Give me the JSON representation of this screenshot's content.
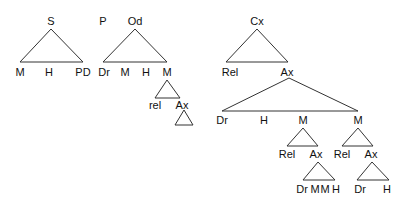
{
  "diagram": {
    "type": "syntax-trees",
    "stroke_color": "#333333",
    "trees": [
      {
        "root": "S",
        "children": [
          "M",
          "H",
          "PD"
        ]
      },
      {
        "pre_label": "P",
        "root": "Od",
        "children": [
          "Dr",
          "M",
          "H",
          "M"
        ],
        "sub": {
          "parent": "M",
          "children": [
            "rel",
            "Ax"
          ],
          "leaf_triangle_under": "Ax"
        }
      },
      {
        "root": "Cx",
        "children": [
          "Rel",
          "Ax"
        ],
        "sub": {
          "parent": "Ax",
          "children": [
            "Dr",
            "H",
            "M",
            "M"
          ],
          "branches": [
            {
              "parent": "M",
              "children": [
                "Rel",
                "Ax"
              ],
              "ax_children": [
                "Dr",
                "M",
                "M",
                "H"
              ]
            },
            {
              "parent": "M",
              "children": [
                "Rel",
                "Ax"
              ],
              "ax_children": [
                "Dr",
                "H"
              ]
            }
          ]
        }
      }
    ]
  },
  "labels": {
    "s": "S",
    "s_m": "M",
    "s_h": "H",
    "s_pd": "PD",
    "p": "P",
    "od": "Od",
    "od_dr": "Dr",
    "od_m1": "M",
    "od_h": "H",
    "od_m2": "M",
    "od_rel": "rel",
    "od_ax": "Ax",
    "cx": "Cx",
    "cx_rel": "Rel",
    "cx_ax": "Ax",
    "ax_dr": "Dr",
    "ax_h": "H",
    "ax_m1": "M",
    "ax_m2": "M",
    "m1_rel": "Rel",
    "m1_ax": "Ax",
    "m2_rel": "Rel",
    "m2_ax": "Ax",
    "m1ax_dr": "Dr",
    "m1ax_m1": "M",
    "m1ax_m2": "M",
    "m1ax_h": "H",
    "m2ax_dr": "Dr",
    "m2ax_h": "H"
  }
}
